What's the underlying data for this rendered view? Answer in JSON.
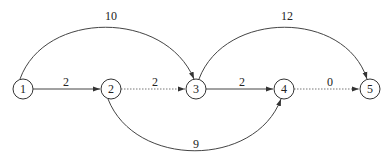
{
  "diagram": {
    "nodes": [
      {
        "id": "1",
        "label": "1",
        "x": 23,
        "y": 89
      },
      {
        "id": "2",
        "label": "2",
        "x": 111,
        "y": 89
      },
      {
        "id": "3",
        "label": "3",
        "x": 196,
        "y": 89
      },
      {
        "id": "4",
        "label": "4",
        "x": 284,
        "y": 89
      },
      {
        "id": "5",
        "label": "5",
        "x": 370,
        "y": 89
      }
    ],
    "edges": [
      {
        "from": "1",
        "to": "2",
        "label": "2",
        "style": "solid",
        "shape": "straight"
      },
      {
        "from": "2",
        "to": "3",
        "label": "2",
        "style": "dotted",
        "shape": "straight"
      },
      {
        "from": "3",
        "to": "4",
        "label": "2",
        "style": "solid",
        "shape": "straight"
      },
      {
        "from": "4",
        "to": "5",
        "label": "0",
        "style": "dotted",
        "shape": "straight"
      },
      {
        "from": "1",
        "to": "3",
        "label": "10",
        "style": "solid",
        "shape": "arc-over"
      },
      {
        "from": "3",
        "to": "5",
        "label": "12",
        "style": "solid",
        "shape": "arc-over"
      },
      {
        "from": "2",
        "to": "4",
        "label": "9",
        "style": "solid",
        "shape": "arc-under"
      }
    ]
  }
}
